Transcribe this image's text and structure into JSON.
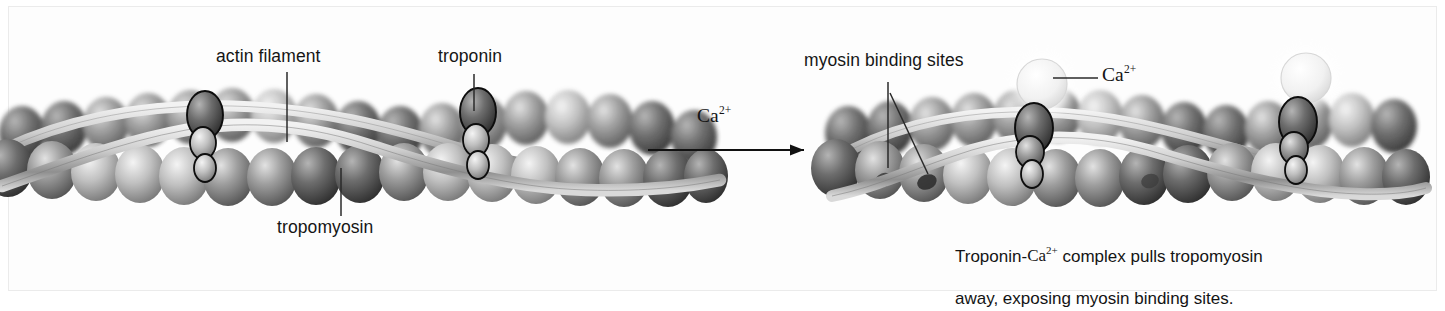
{
  "figure": {
    "background_color": "#ffffff",
    "ink_color": "#1a1a1a"
  },
  "left_panel": {
    "name": "relaxed-state",
    "labels": [
      {
        "id": "actin-filament",
        "text": "actin filament"
      },
      {
        "id": "troponin",
        "text": "troponin"
      },
      {
        "id": "tropomyosin",
        "text": "tropomyosin"
      }
    ]
  },
  "arrow": {
    "label": "Ca",
    "label_sup": "2+",
    "direction": "right"
  },
  "right_panel": {
    "name": "activated-state",
    "labels": [
      {
        "id": "myosin-binding-sites",
        "text": "myosin binding sites"
      },
      {
        "id": "calcium-ion",
        "text": "Ca",
        "sup": "2+"
      }
    ],
    "caption_line1_pre": "Troponin-",
    "caption_line1_ion": "Ca",
    "caption_line1_sup": "2+",
    "caption_line1_post": " complex pulls tropomyosin",
    "caption_line2": "away, exposing myosin binding sites."
  },
  "colors": {
    "sphere_dark": "#4a4a4a",
    "sphere_mid": "#8d8d8d",
    "sphere_light": "#d8d8d8",
    "calcium": "#f0f0f0",
    "tropomyosin": "#bdbdbd",
    "outline": "#111111"
  }
}
